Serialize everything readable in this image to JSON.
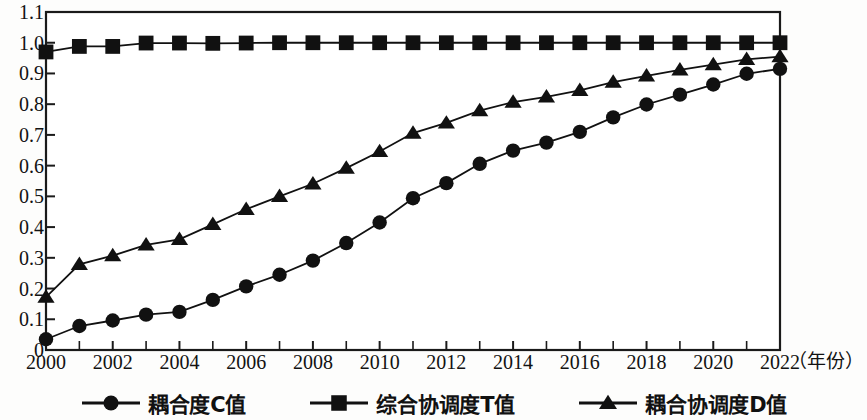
{
  "chart_data": {
    "type": "line",
    "title": "",
    "xlabel": "（年份）",
    "ylabel": "",
    "xlim": [
      2000,
      2022
    ],
    "ylim": [
      0,
      1.1
    ],
    "grid": false,
    "legend_position": "bottom",
    "x": [
      2000,
      2001,
      2002,
      2003,
      2004,
      2005,
      2006,
      2007,
      2008,
      2009,
      2010,
      2011,
      2012,
      2013,
      2014,
      2015,
      2016,
      2017,
      2018,
      2019,
      2020,
      2021,
      2022
    ],
    "y_ticks": [
      "0",
      "0.1",
      "0.2",
      "0.3",
      "0.4",
      "0.5",
      "0.6",
      "0.7",
      "0.8",
      "0.9",
      "1.0",
      "1.1"
    ],
    "y_tick_values": [
      0,
      0.1,
      0.2,
      0.3,
      0.4,
      0.5,
      0.6,
      0.7,
      0.8,
      0.9,
      1.0,
      1.1
    ],
    "x_ticks": [
      "2000",
      "2002",
      "2004",
      "2006",
      "2008",
      "2010",
      "2012",
      "2014",
      "2016",
      "2018",
      "2020",
      "2022"
    ],
    "x_tick_values": [
      2000,
      2002,
      2004,
      2006,
      2008,
      2010,
      2012,
      2014,
      2016,
      2018,
      2020,
      2022
    ],
    "series": [
      {
        "name": "耦合度C值",
        "marker": "circle",
        "color": "#111111",
        "values": [
          0.035,
          0.078,
          0.096,
          0.115,
          0.124,
          0.163,
          0.207,
          0.245,
          0.291,
          0.348,
          0.415,
          0.494,
          0.543,
          0.606,
          0.649,
          0.675,
          0.71,
          0.757,
          0.799,
          0.831,
          0.864,
          0.899,
          0.915
        ]
      },
      {
        "name": "综合协调度T值",
        "marker": "square",
        "color": "#111111",
        "values": [
          0.97,
          0.988,
          0.988,
          0.999,
          0.999,
          0.998,
          0.999,
          1.0,
          1.0,
          1.0,
          1.0,
          1.0,
          1.0,
          1.0,
          1.0,
          1.0,
          1.0,
          1.0,
          1.0,
          1.0,
          1.0,
          1.0,
          1.0
        ]
      },
      {
        "name": "耦合协调度D值",
        "marker": "triangle",
        "color": "#111111",
        "values": [
          0.172,
          0.279,
          0.307,
          0.342,
          0.36,
          0.409,
          0.458,
          0.5,
          0.541,
          0.592,
          0.646,
          0.706,
          0.739,
          0.779,
          0.807,
          0.824,
          0.845,
          0.872,
          0.892,
          0.912,
          0.929,
          0.946,
          0.955
        ]
      }
    ]
  },
  "legend": {
    "items": [
      {
        "label": "耦合度C值",
        "marker": "circle"
      },
      {
        "label": "综合协调度T值",
        "marker": "square"
      },
      {
        "label": "耦合协调度D值",
        "marker": "triangle"
      }
    ]
  },
  "axis": {
    "x_unit_label": "（年份）"
  }
}
